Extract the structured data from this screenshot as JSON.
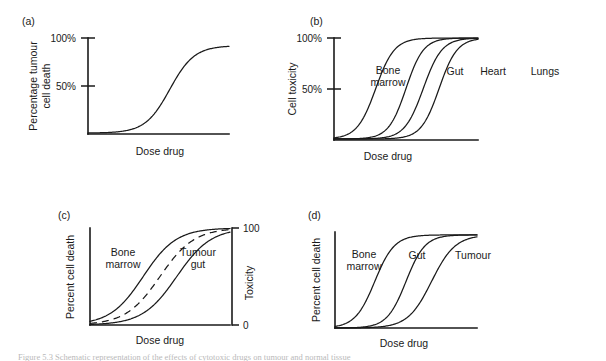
{
  "figure": {
    "background_color": "#ffffff",
    "ink_color": "#1a1a1a",
    "caption_fragment": "Figure 5.3   Schematic representation of the effects of cytotoxic drugs on tumour and normal tissue"
  },
  "panels": [
    {
      "id": "a",
      "letter": "(a)",
      "y_axis_label_line1": "Percentage tumour",
      "y_axis_label_line2": "cell death",
      "x_axis_label": "Dose drug",
      "y_ticks": [
        "100%",
        "50%"
      ],
      "right_axis_label": "",
      "right_ticks": [],
      "curve_labels": []
    },
    {
      "id": "b",
      "letter": "(b)",
      "y_axis_label_line1": "Cell toxicity",
      "y_axis_label_line2": "",
      "x_axis_label": "Dose drug",
      "y_ticks": [
        "100%",
        "50%"
      ],
      "right_axis_label": "",
      "right_ticks": [],
      "curve_labels": [
        "Bone",
        "marrow",
        "Gut",
        "Heart",
        "Lungs"
      ]
    },
    {
      "id": "c",
      "letter": "(c)",
      "y_axis_label_line1": "Percent cell death",
      "y_axis_label_line2": "",
      "x_axis_label": "Dose drug",
      "y_ticks": [],
      "right_axis_label": "Toxicity",
      "right_ticks": [
        "100",
        "0"
      ],
      "curve_labels": [
        "Bone",
        "marrow",
        "Tumour",
        "gut"
      ]
    },
    {
      "id": "d",
      "letter": "(d)",
      "y_axis_label_line1": "Percent cell death",
      "y_axis_label_line2": "",
      "x_axis_label": "Dose drug",
      "y_ticks": [],
      "right_axis_label": "",
      "right_ticks": [],
      "curve_labels": [
        "Bone",
        "marrow",
        "Gut",
        "Tumour"
      ]
    }
  ],
  "labels": {
    "panel_a_letter": "(a)",
    "panel_b_letter": "(b)",
    "panel_c_letter": "(c)",
    "panel_d_letter": "(d)",
    "dose_drug": "Dose drug",
    "percentage_tumour": "Percentage tumour",
    "cell_death": "cell death",
    "cell_toxicity": "Cell toxicity",
    "percent_cell_death": "Percent cell death",
    "toxicity": "Toxicity",
    "tick_100pct": "100%",
    "tick_50pct": "50%",
    "tick_100": "100",
    "tick_0": "0",
    "bone": "Bone",
    "marrow": "marrow",
    "gut": "Gut",
    "heart": "Heart",
    "lungs": "Lungs",
    "tumour": "Tumour",
    "tumour_gut_line2": "gut"
  },
  "chart_data": {
    "type": "line",
    "title": "",
    "panels": [
      {
        "id": "a",
        "title": "(a)",
        "xlabel": "Dose drug",
        "ylabel": "Percentage tumour cell death",
        "ytick_labels": [
          "50%",
          "100%"
        ],
        "ytick_values": [
          50,
          100
        ],
        "ylim": [
          0,
          100
        ],
        "xlim": [
          0,
          100
        ],
        "grid": false,
        "legend": "none",
        "series": [
          {
            "name": "Tumour cell death",
            "style": "solid",
            "shape": "sigmoid",
            "midpoint_x": 58,
            "steepness": 0.115,
            "plateau_y": 92,
            "baseline_y": 1
          }
        ]
      },
      {
        "id": "b",
        "title": "(b)",
        "xlabel": "Dose drug",
        "ylabel": "Cell toxicity",
        "ytick_labels": [
          "50%",
          "100%"
        ],
        "ytick_values": [
          50,
          100
        ],
        "ylim": [
          0,
          100
        ],
        "xlim": [
          0,
          100
        ],
        "grid": false,
        "legend": "inline-curve-labels",
        "series": [
          {
            "name": "Bone marrow",
            "style": "solid",
            "shape": "sigmoid",
            "midpoint_x": 29,
            "steepness": 0.155,
            "plateau_y": 100,
            "baseline_y": 1
          },
          {
            "name": "Gut",
            "style": "solid",
            "shape": "sigmoid",
            "midpoint_x": 50,
            "steepness": 0.165,
            "plateau_y": 100,
            "baseline_y": 1
          },
          {
            "name": "Heart",
            "style": "solid",
            "shape": "sigmoid",
            "midpoint_x": 62,
            "steepness": 0.155,
            "plateau_y": 100,
            "baseline_y": 1
          },
          {
            "name": "Lungs",
            "style": "solid",
            "shape": "sigmoid",
            "midpoint_x": 73,
            "steepness": 0.16,
            "plateau_y": 100,
            "baseline_y": 1
          }
        ]
      },
      {
        "id": "c",
        "title": "(c)",
        "xlabel": "Dose drug",
        "ylabel": "Percent cell death",
        "y2label": "Toxicity",
        "y2tick_labels": [
          "0",
          "100"
        ],
        "y2tick_values": [
          0,
          100
        ],
        "ylim": [
          0,
          100
        ],
        "xlim": [
          0,
          100
        ],
        "grid": false,
        "legend": "inline-curve-labels",
        "series": [
          {
            "name": "Bone marrow",
            "style": "solid",
            "shape": "sigmoid",
            "midpoint_x": 38,
            "steepness": 0.085,
            "plateau_y": 100,
            "baseline_y": 0
          },
          {
            "name": "Intermediate (dashed)",
            "style": "dashed",
            "shape": "sigmoid",
            "midpoint_x": 50,
            "steepness": 0.082,
            "plateau_y": 100,
            "baseline_y": 0
          },
          {
            "name": "Tumour gut",
            "style": "solid",
            "shape": "sigmoid",
            "midpoint_x": 62,
            "steepness": 0.082,
            "plateau_y": 100,
            "baseline_y": 0
          }
        ]
      },
      {
        "id": "d",
        "title": "(d)",
        "xlabel": "Dose drug",
        "ylabel": "Percent cell death",
        "ytick_labels": [],
        "ytick_values": [],
        "ylim": [
          0,
          100
        ],
        "xlim": [
          0,
          100
        ],
        "grid": false,
        "legend": "inline-curve-labels",
        "series": [
          {
            "name": "Bone marrow",
            "style": "solid",
            "shape": "sigmoid",
            "midpoint_x": 28,
            "steepness": 0.145,
            "plateau_y": 97,
            "baseline_y": 0
          },
          {
            "name": "Gut",
            "style": "solid",
            "shape": "sigmoid",
            "midpoint_x": 50,
            "steepness": 0.15,
            "plateau_y": 97,
            "baseline_y": 0
          },
          {
            "name": "Tumour",
            "style": "solid",
            "shape": "sigmoid",
            "midpoint_x": 68,
            "steepness": 0.12,
            "plateau_y": 97,
            "baseline_y": 0
          }
        ]
      }
    ]
  }
}
